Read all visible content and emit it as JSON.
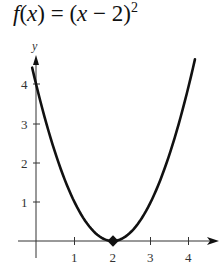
{
  "chart_data": {
    "type": "line",
    "function": "(x - 2)^2",
    "xlabel": "",
    "ylabel": "y",
    "x_ticks": [
      1,
      2,
      3,
      4
    ],
    "y_ticks": [
      1,
      2,
      3,
      4
    ],
    "xlim": [
      -0.1,
      4.8
    ],
    "ylim": [
      -0.1,
      4.6
    ],
    "grid": false,
    "legend": null,
    "series": [
      {
        "name": "f(x) = (x − 2)²",
        "x": [
          -0.1,
          0,
          0.5,
          1,
          1.5,
          2,
          2.5,
          3,
          3.5,
          4,
          4.15
        ],
        "values": [
          4.41,
          4,
          2.25,
          1,
          0.25,
          0,
          0.25,
          1,
          2.25,
          4,
          4.62
        ]
      }
    ],
    "annotations": [
      {
        "type": "point",
        "x": 2,
        "y": 0,
        "label": "vertex"
      }
    ],
    "color": "#111111"
  },
  "title": {
    "f": "f",
    "open": "(",
    "x": "x",
    "rest": ") = (",
    "x2": "x",
    "tail": " − 2)",
    "sup": "2"
  },
  "axes": {
    "y_label": "y",
    "x_tick_labels": [
      "1",
      "2",
      "3",
      "4"
    ],
    "y_tick_labels": [
      "1",
      "2",
      "3",
      "4"
    ]
  }
}
